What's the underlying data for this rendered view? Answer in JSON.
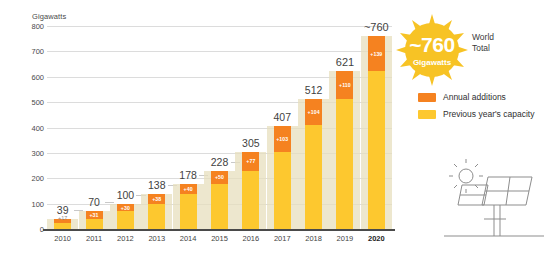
{
  "axis": {
    "y_unit": "Gigawatts",
    "y_ticks": [
      "800",
      "700",
      "600",
      "500",
      "400",
      "300",
      "200",
      "100",
      "0"
    ],
    "x_ticks": [
      "2010",
      "2011",
      "2012",
      "2013",
      "2014",
      "2015",
      "2016",
      "2017",
      "2018",
      "2019",
      "2020"
    ]
  },
  "callout": {
    "value": "~760",
    "unit": "Gigawatts",
    "side_line1": "World",
    "side_line2": "Total"
  },
  "legend": {
    "items": [
      {
        "label": "Annual additions",
        "color": "#f58220"
      },
      {
        "label": "Previous year's capacity",
        "color": "#fdc82f"
      }
    ]
  },
  "icons": {
    "sun": "sun-icon",
    "panels": "solar-panel-icon",
    "starburst": "starburst-icon"
  },
  "chart_data": {
    "type": "bar",
    "title": "",
    "xlabel": "",
    "ylabel": "Gigawatts",
    "ylim": [
      0,
      800
    ],
    "grid": true,
    "legend_position": "right",
    "categories": [
      "2010",
      "2011",
      "2012",
      "2013",
      "2014",
      "2015",
      "2016",
      "2017",
      "2018",
      "2019",
      "2020"
    ],
    "totals": [
      "39",
      "70",
      "100",
      "138",
      "178",
      "228",
      "305",
      "407",
      "512",
      "621",
      "~760"
    ],
    "total_values": [
      39,
      70,
      100,
      138,
      178,
      228,
      305,
      407,
      512,
      621,
      760
    ],
    "additions_labels": [
      "+17",
      "+31",
      "+30",
      "+38",
      "+40",
      "+50",
      "+77",
      "+103",
      "+104",
      "+110",
      "+139"
    ],
    "series": [
      {
        "name": "Previous year's capacity",
        "color": "#fdc82f",
        "values": [
          22,
          39,
          70,
          100,
          138,
          178,
          228,
          305,
          408,
          511,
          621
        ]
      },
      {
        "name": "Annual additions",
        "color": "#f58220",
        "values": [
          17,
          31,
          30,
          38,
          40,
          50,
          77,
          102,
          104,
          110,
          139
        ]
      }
    ]
  }
}
